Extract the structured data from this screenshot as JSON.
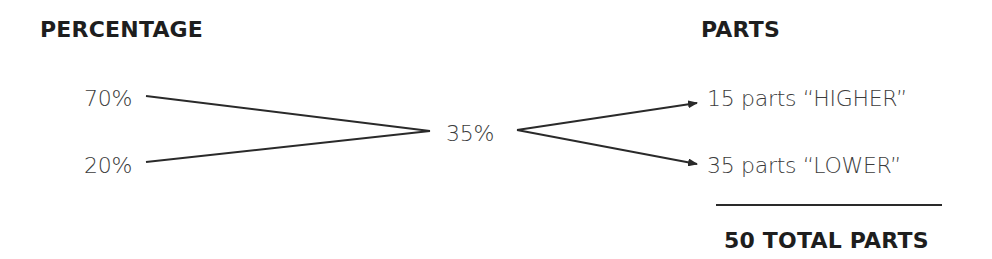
{
  "headings": {
    "left": "PERCENTAGE",
    "right": "PARTS"
  },
  "inputs": [
    {
      "label": "70%"
    },
    {
      "label": "20%"
    }
  ],
  "mixture": {
    "label": "35%"
  },
  "outputs": [
    {
      "label": "15 parts “HIGHER”"
    },
    {
      "label": "35 parts “LOWER”"
    }
  ],
  "total": {
    "label": "50 TOTAL PARTS"
  },
  "colors": {
    "text": "#3c3c3c",
    "heading": "#1e1e1e",
    "lines": "#2a2a2a"
  }
}
